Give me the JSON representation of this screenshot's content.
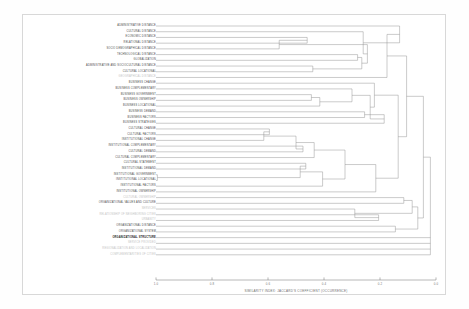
{
  "figure": {
    "kind": "dendrogram",
    "background": "#ffffff",
    "frame_color": "#d8d8d8",
    "line_color": "#8a8a8a"
  },
  "axis": {
    "title": "SIMILARITY INDEX: JACCARD'S COEFFICIENT (OCCURRENCE)",
    "ticks": [
      "1.0",
      "0.8",
      "0.6",
      "0.4",
      "0.2",
      "0.0"
    ],
    "min": 0.0,
    "max": 1.0,
    "reversed": true
  },
  "chart_data": {
    "type": "dendrogram",
    "title": "",
    "xlabel": "SIMILARITY INDEX: JACCARD'S COEFFICIENT (OCCURRENCE)",
    "ylabel": "",
    "xlim": [
      1.0,
      0.0
    ],
    "grid": false,
    "legend": "none",
    "distance_metric": "Jaccard's coefficient (occurrence)",
    "leaves": [
      {
        "label": "ADMINISTRATIVE DISTANCE",
        "style": "dark",
        "merge_at": 0.13
      },
      {
        "label": "CULTURAL DISTANCE",
        "style": "dark",
        "merge_at": 0.26
      },
      {
        "label": "ECONOMIC DISTANCE",
        "style": "dark",
        "merge_at": 0.46
      },
      {
        "label": "RELATIONAL DISTANCE",
        "style": "dark",
        "merge_at": 0.46
      },
      {
        "label": "SOCIO DEMOGRAPHICAL DISTANCE",
        "style": "dark",
        "merge_at": 0.56
      },
      {
        "label": "TECHNOLOGICAL DISTANCE",
        "style": "dark",
        "merge_at": 0.28
      },
      {
        "label": "GLOBALIZATION",
        "style": "dark",
        "merge_at": 0.28
      },
      {
        "label": "ADMINISTRATIVE AND SOCIOCULTURAL DISTANCE",
        "style": "dark",
        "merge_at": 0.44
      },
      {
        "label": "CULTURAL LOCATIONAL",
        "style": "dark",
        "merge_at": 0.44
      },
      {
        "label": "GEOGRAPHICAL DISTANCE",
        "style": "faint",
        "merge_at": 0.175
      },
      {
        "label": "BUSINESS CHANGE",
        "style": "dark",
        "merge_at": 0.22
      },
      {
        "label": "BUSINESS COMPLEMENTARY",
        "style": "dark",
        "merge_at": 0.3
      },
      {
        "label": "BUSINESS GOVERNMENT",
        "style": "dark",
        "merge_at": 0.445
      },
      {
        "label": "BUSINESS OWNERSHIP",
        "style": "dark",
        "merge_at": 0.445
      },
      {
        "label": "BUSINESS LOCATIONAL",
        "style": "dark",
        "merge_at": 0.415
      },
      {
        "label": "BUSINESS DEMAND",
        "style": "dark",
        "merge_at": 0.255
      },
      {
        "label": "BUSINESS FACTORS",
        "style": "dark",
        "merge_at": 0.255
      },
      {
        "label": "BUSINESS STRATEGIES",
        "style": "dark",
        "merge_at": 0.185
      },
      {
        "label": "CULTURAL CHANGE",
        "style": "dark",
        "merge_at": 0.595
      },
      {
        "label": "CULTURAL FACTORS",
        "style": "dark",
        "merge_at": 0.595
      },
      {
        "label": "INSTITUTIONAL CHANGE",
        "style": "dark",
        "merge_at": 0.615
      },
      {
        "label": "INSTITUTIONAL COMPLEMENTARY",
        "style": "dark",
        "merge_at": 0.475
      },
      {
        "label": "CULTURAL DEMAND",
        "style": "dark",
        "merge_at": 0.475
      },
      {
        "label": "CULTURAL COMPLEMENTARY",
        "style": "dark",
        "merge_at": 0.435
      },
      {
        "label": "CULTURAL STATEMENT",
        "style": "dark",
        "merge_at": 0.465
      },
      {
        "label": "INSTITUTIONAL DEMAND",
        "style": "dark",
        "merge_at": 0.465
      },
      {
        "label": "INSTITUTIONAL GOVERNMENT",
        "style": "dark",
        "merge_at": 0.995
      },
      {
        "label": "INSTITUTIONAL LOCATIONAL",
        "style": "dark",
        "merge_at": 0.995
      },
      {
        "label": "INSTITUTIONAL FACTORS",
        "style": "dark",
        "merge_at": 0.405
      },
      {
        "label": "INSTITUTIONAL OWNERSHIP",
        "style": "dark",
        "merge_at": 0.215
      },
      {
        "label": "CULTURAL OWNERSHIP",
        "style": "faint",
        "merge_at": 0.115
      },
      {
        "label": "ORGANIZATIONAL VALUES AND CULTURE",
        "style": "dark",
        "merge_at": 0.115
      },
      {
        "label": "SERVICES",
        "style": "faint",
        "merge_at": 0.29
      },
      {
        "label": "RELATIONSHIP OF NEIGHBORING CITIES",
        "style": "faint",
        "merge_at": 0.205
      },
      {
        "label": "URBANITY",
        "style": "faint",
        "merge_at": 0.205
      },
      {
        "label": "ORGANIZATIONAL DISTANCE",
        "style": "dark",
        "merge_at": 0.145
      },
      {
        "label": "ORGANIZATIONAL SYSTEM",
        "style": "dark",
        "merge_at": 0.145
      },
      {
        "label": "ORGANIZATIONAL STRUCTURE",
        "style": "bold",
        "merge_at": 0.0
      },
      {
        "label": "SERVICE PROVIDED",
        "style": "faint",
        "merge_at": 0.0
      },
      {
        "label": "REGIONALIZATION AND LOCALIZATION",
        "style": "faint",
        "merge_at": 0.0
      },
      {
        "label": "COMPLEMENTARITIES OF CITIES",
        "style": "faint",
        "merge_at": 0.0
      }
    ]
  }
}
